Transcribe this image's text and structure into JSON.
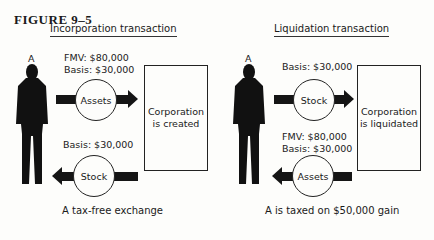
{
  "figure": {
    "label": "FIGURE 9–5",
    "panels": [
      {
        "title": "Incorporation transaction",
        "person_label": "A",
        "top_flow": {
          "item": "Assets",
          "direction": "to-corporation",
          "values": [
            "FMV: $80,000",
            "Basis: $30,000"
          ]
        },
        "box_text": [
          "Corporation",
          "is created"
        ],
        "bottom_flow": {
          "item": "Stock",
          "direction": "to-person",
          "values": [
            "Basis: $30,000"
          ]
        },
        "caption": "A tax-free exchange"
      },
      {
        "title": "Liquidation transaction",
        "person_label": "A",
        "top_flow": {
          "item": "Stock",
          "direction": "to-corporation",
          "values": [
            "Basis: $30,000"
          ]
        },
        "box_text": [
          "Corporation",
          "is liquidated"
        ],
        "bottom_flow": {
          "item": "Assets",
          "direction": "to-person",
          "values": [
            "FMV: $80,000",
            "Basis: $30,000"
          ]
        },
        "caption": "A is taxed on $50,000 gain"
      }
    ]
  }
}
